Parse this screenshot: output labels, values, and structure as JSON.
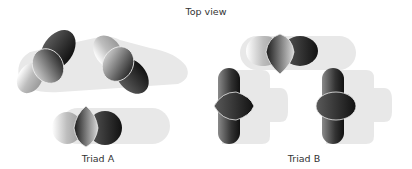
{
  "figure": {
    "title": "Top view",
    "panels": [
      {
        "id": "triad-a",
        "label": "Triad A"
      },
      {
        "id": "triad-b",
        "label": "Triad B"
      }
    ]
  },
  "colors": {
    "background": "#ffffff",
    "text": "#333333",
    "shadow_platform": "#e6e6e6",
    "lobe_dark": "#1a1a1a",
    "lobe_light": "#cfcfcf",
    "outline": "#f2f2f2"
  }
}
